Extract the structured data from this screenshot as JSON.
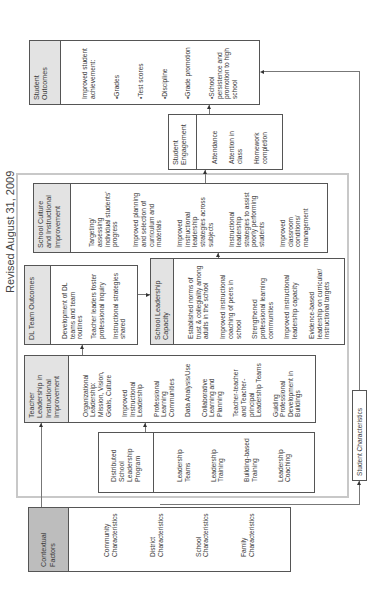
{
  "title": "Revised August 31, 2009",
  "diagram": {
    "student_outcomes": {
      "header": "Student Outcomes",
      "items": [
        "Improved student achievement:",
        "•Grades",
        "•Test scores",
        "•Discipline",
        "•Grade promotion",
        "•School persistence and promotion to high school"
      ]
    },
    "student_engagement": {
      "header": "Student Engagement",
      "items": [
        "Attendance",
        "Attention in class",
        "Homework completion"
      ]
    },
    "school_culture": {
      "header": "School Culture and Instructional Improvement",
      "items": [
        "Targeting/ assessing individual students' progress",
        "Improved planning and selection of curriculum and materials",
        "Improved instructional leadership strategies across subjects",
        "Instructional leadership strategies to assist poorly performing students",
        "Improved classroom conditions/ management"
      ]
    },
    "dl_team_outcomes": {
      "header": "DL Team Outcomes",
      "items": [
        "Development of DL teams and team routines",
        "Teacher leaders foster professional inquiry",
        "Instructional strategies shared"
      ]
    },
    "school_leadership_capacity": {
      "header": "School Leadership Capacity",
      "items": [
        "Established norms of trust & collegiality among adults in the school",
        "Improved instructional coaching of peers in school",
        "Strengthened professional learning communities",
        "Improved instructional leadership capacity",
        "Evidence-based leadership on curricular/ instructional targets"
      ]
    },
    "teacher_leadership": {
      "header": "Teacher Leadership in Instructional Improvement",
      "items": [
        "Organizational Leadership: Mission, Vision, Goals, Culture",
        "Improved Instructional Leadership",
        "Professional Learning Communities",
        "Data Analysis/Use",
        "Collaborative Learning and Planning",
        "Teacher-teacher and Teacher-principal Leadership Teams",
        "Guiding Professional Development in Buildings"
      ]
    },
    "dl_program": {
      "header": "Distributed School Leadership Program",
      "items": [
        "Leadership Teams",
        "Leadership Training",
        "Building-based Training",
        "Leadership Coaching"
      ]
    },
    "contextual_factors": {
      "header": "Contextual Factors",
      "items": [
        "Community Characteristics",
        "District Characteristics",
        "School Characteristics",
        "Family Characteristics"
      ]
    },
    "student_characteristics": {
      "label": "Student Characteristics"
    }
  }
}
